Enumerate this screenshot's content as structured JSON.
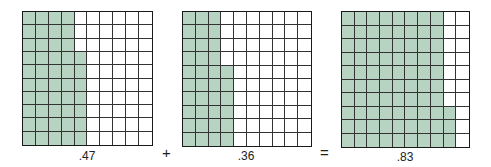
{
  "diagram": {
    "type": "decimal-addition-hundred-grids",
    "shade_color": "#b7d4c3",
    "grids": [
      {
        "label": ".47",
        "value": 0.47,
        "full_columns": 4,
        "partial_column_cells": 7,
        "partial_from": "bottom"
      },
      {
        "label": ".36",
        "value": 0.36,
        "full_columns": 3,
        "partial_column_cells": 6,
        "partial_from": "bottom"
      },
      {
        "label": ".83",
        "value": 0.83,
        "full_columns": 8,
        "partial_column_cells": 3,
        "partial_from": "bottom"
      }
    ],
    "operators": {
      "plus": "+",
      "equals": "="
    }
  }
}
